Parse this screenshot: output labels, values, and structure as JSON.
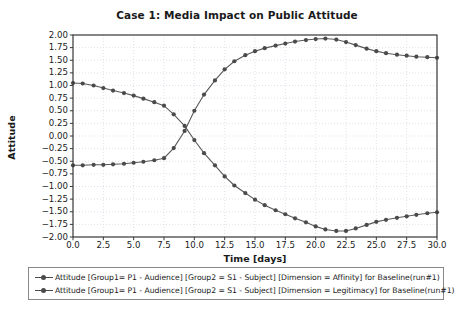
{
  "chart_data": {
    "type": "line",
    "title": "Case 1: Media Impact on Public Attitude",
    "xlabel": "Time [days]",
    "ylabel": "Attitude",
    "xlim": [
      0.0,
      30.0
    ],
    "ylim": [
      -2.0,
      2.0
    ],
    "grid": true,
    "legend_position": "below-axes",
    "xticks": [
      "0.0",
      "2.5",
      "5.0",
      "7.5",
      "10.0",
      "12.5",
      "15.0",
      "17.5",
      "20.0",
      "22.5",
      "25.0",
      "27.5",
      "30.0"
    ],
    "xtick_values": [
      0.0,
      2.5,
      5.0,
      7.5,
      10.0,
      12.5,
      15.0,
      17.5,
      20.0,
      22.5,
      25.0,
      27.5,
      30.0
    ],
    "yticks": [
      "2.00",
      "1.75",
      "1.50",
      "1.25",
      "1.00",
      "0.75",
      "0.50",
      "0.25",
      "0.00",
      "-0.25",
      "-0.50",
      "-0.75",
      "-1.00",
      "-1.25",
      "-1.50",
      "-1.75",
      "-2.00"
    ],
    "ytick_values": [
      2.0,
      1.75,
      1.5,
      1.25,
      1.0,
      0.75,
      0.5,
      0.25,
      0.0,
      -0.25,
      -0.5,
      -0.75,
      -1.0,
      -1.25,
      -1.5,
      -1.75,
      -2.0
    ],
    "marker": "circle",
    "marker_color": "#4a4a4a",
    "line_color": "#5a5a5a",
    "x": [
      0.0,
      0.8,
      1.7,
      2.5,
      3.3,
      4.2,
      5.0,
      5.8,
      6.7,
      7.5,
      8.3,
      9.2,
      10.0,
      10.8,
      11.7,
      12.5,
      13.3,
      14.2,
      15.0,
      15.8,
      16.7,
      17.5,
      18.3,
      19.2,
      20.0,
      20.8,
      21.7,
      22.5,
      23.3,
      24.2,
      25.0,
      25.8,
      26.7,
      27.5,
      28.3,
      29.2,
      30.0
    ],
    "series": [
      {
        "name": "Attitude [Group1= P1 - Audience] [Group2 = S1 - Subject] [Dimension = Affinity] for Baseline(run#1)",
        "short_name": "Affinity",
        "values": [
          -0.58,
          -0.58,
          -0.57,
          -0.57,
          -0.56,
          -0.55,
          -0.53,
          -0.51,
          -0.48,
          -0.44,
          -0.24,
          0.1,
          0.5,
          0.82,
          1.1,
          1.32,
          1.48,
          1.6,
          1.68,
          1.74,
          1.79,
          1.83,
          1.87,
          1.9,
          1.92,
          1.93,
          1.91,
          1.86,
          1.8,
          1.73,
          1.68,
          1.64,
          1.61,
          1.59,
          1.57,
          1.56,
          1.55
        ]
      },
      {
        "name": "Attitude [Group1= P1 - Audience] [Group2 = S1 - Subject] [Dimension = Legitimacy] for Baseline(run#1)",
        "short_name": "Legitimacy",
        "values": [
          1.05,
          1.04,
          1.0,
          0.95,
          0.9,
          0.85,
          0.8,
          0.74,
          0.67,
          0.6,
          0.43,
          0.2,
          -0.08,
          -0.34,
          -0.58,
          -0.8,
          -0.98,
          -1.13,
          -1.26,
          -1.37,
          -1.47,
          -1.55,
          -1.63,
          -1.71,
          -1.79,
          -1.85,
          -1.88,
          -1.88,
          -1.83,
          -1.76,
          -1.7,
          -1.66,
          -1.62,
          -1.59,
          -1.56,
          -1.53,
          -1.51
        ]
      }
    ]
  },
  "axes": {
    "frame_color": "#3a3a3a",
    "grid_color": "#d9d9e3",
    "background": "#ffffff"
  }
}
